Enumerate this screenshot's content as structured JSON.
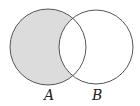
{
  "diagram": {
    "type": "venn",
    "title": "",
    "shaded_region": "A minus B",
    "sets": [
      {
        "label": "A",
        "cx": 48,
        "cy": 47,
        "r": 38
      },
      {
        "label": "B",
        "cx": 96,
        "cy": 47,
        "r": 37
      }
    ],
    "colors": {
      "shade": "#dcdcdc",
      "stroke": "#555555",
      "background": "#ffffff"
    }
  }
}
